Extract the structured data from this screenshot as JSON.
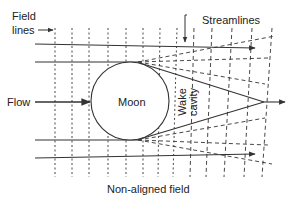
{
  "labels": {
    "field_lines_1": "Field",
    "field_lines_2": "lines",
    "streamlines": "Streamlines",
    "flow": "Flow",
    "moon": "Moon",
    "wake": "Wake",
    "cavity": "cavity",
    "non_aligned_field": "Non-aligned field"
  },
  "colors": {
    "line": "#333333",
    "background": "#ffffff"
  }
}
